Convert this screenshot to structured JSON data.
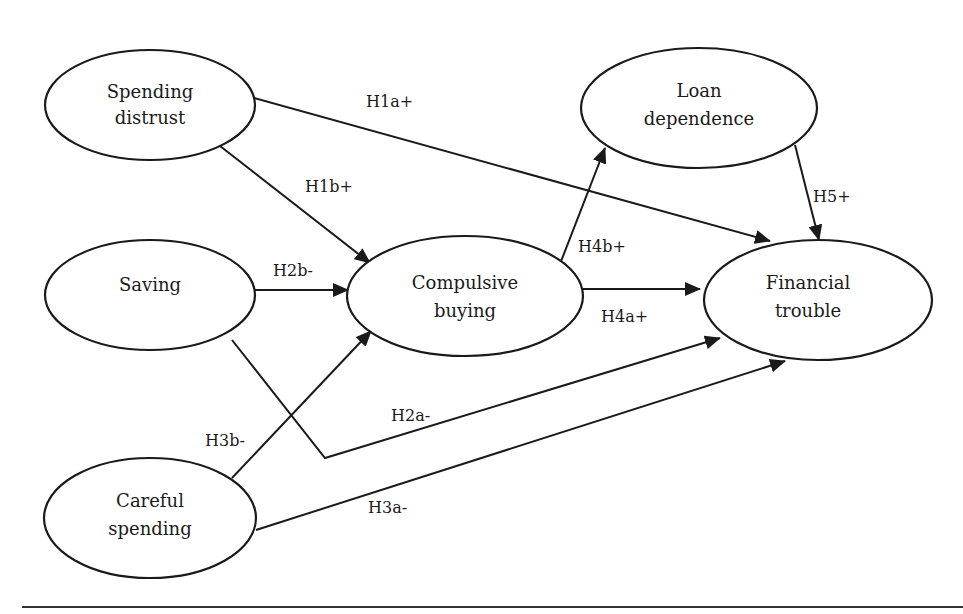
{
  "diagram": {
    "type": "path-model",
    "nodes": [
      {
        "id": "spending_distrust",
        "line1": "Spending",
        "line2": "distrust"
      },
      {
        "id": "saving",
        "line1": "Saving",
        "line2": ""
      },
      {
        "id": "careful_spending",
        "line1": "Careful",
        "line2": "spending"
      },
      {
        "id": "compulsive_buying",
        "line1": "Compulsive",
        "line2": "buying"
      },
      {
        "id": "loan_dependence",
        "line1": "Loan",
        "line2": "dependence"
      },
      {
        "id": "financial_trouble",
        "line1": "Financial",
        "line2": "trouble"
      }
    ],
    "edges": [
      {
        "from": "spending_distrust",
        "to": "financial_trouble",
        "label": "H1a+"
      },
      {
        "from": "spending_distrust",
        "to": "compulsive_buying",
        "label": "H1b+"
      },
      {
        "from": "saving",
        "to": "compulsive_buying",
        "label": "H2b-"
      },
      {
        "from": "saving",
        "to": "financial_trouble",
        "label": "H2a-"
      },
      {
        "from": "careful_spending",
        "to": "compulsive_buying",
        "label": "H3b-"
      },
      {
        "from": "careful_spending",
        "to": "financial_trouble",
        "label": "H3a-"
      },
      {
        "from": "compulsive_buying",
        "to": "financial_trouble",
        "label": "H4a+"
      },
      {
        "from": "compulsive_buying",
        "to": "loan_dependence",
        "label": "H4b+"
      },
      {
        "from": "loan_dependence",
        "to": "financial_trouble",
        "label": "H5+"
      }
    ]
  }
}
